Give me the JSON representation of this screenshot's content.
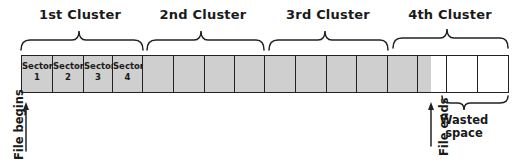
{
  "diagram": {
    "clusters": [
      {
        "label": "1st Cluster",
        "center_x": 80
      },
      {
        "label": "2nd Cluster",
        "center_x": 203
      },
      {
        "label": "3rd Cluster",
        "center_x": 328
      },
      {
        "label": "4th Cluster",
        "center_x": 450
      }
    ],
    "sectors": [
      {
        "label_line1": "Sector",
        "label_line2": "1",
        "state": "used"
      },
      {
        "label_line1": "Sector",
        "label_line2": "2",
        "state": "used"
      },
      {
        "label_line1": "Sector",
        "label_line2": "3",
        "state": "used"
      },
      {
        "label_line1": "Sector",
        "label_line2": "4",
        "state": "used"
      },
      {
        "state": "used"
      },
      {
        "state": "used"
      },
      {
        "state": "used"
      },
      {
        "state": "used"
      },
      {
        "state": "used"
      },
      {
        "state": "used"
      },
      {
        "state": "used"
      },
      {
        "state": "used"
      },
      {
        "state": "used"
      },
      {
        "state": "partial"
      },
      {
        "state": "empty"
      },
      {
        "state": "empty"
      }
    ],
    "annotations": {
      "file_begins": "File begins",
      "file_ends": "File ends",
      "wasted_line1": "Wasted",
      "wasted_line2": "space"
    },
    "colors": {
      "used_fill": "#cfcfcf",
      "empty_fill": "#ffffff",
      "line": "#222222"
    }
  }
}
